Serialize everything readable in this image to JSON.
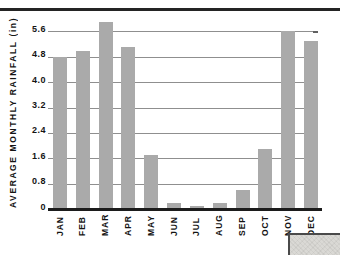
{
  "page": {
    "background": "#ffffff",
    "top_rule_color": "#242424",
    "corner_fragment_color": "#dad9d5"
  },
  "chart_data": {
    "type": "bar",
    "title": "",
    "ylabel": "AVERAGE MONTHLY RAINFALL (in)",
    "xlabel": "",
    "categories": [
      "JAN",
      "FEB",
      "MAR",
      "APR",
      "MAY",
      "JUN",
      "JUL",
      "AUG",
      "SEP",
      "OCT",
      "NOV",
      "DEC"
    ],
    "values": [
      4.8,
      5.0,
      5.9,
      5.1,
      1.7,
      0.2,
      0.1,
      0.2,
      0.6,
      1.9,
      5.6,
      5.3
    ],
    "ylim": [
      0,
      6.0
    ],
    "yticks": [
      0,
      0.8,
      1.6,
      2.4,
      3.2,
      4.0,
      4.8,
      5.6
    ],
    "ytick_labels": [
      "0",
      "0.8",
      "1.6",
      "2.4",
      "3.2",
      "4.0",
      "4.8",
      "5.6"
    ],
    "grid": true,
    "legend": false,
    "bar_color": "#aaaaaa",
    "gridline_color": "#8f8f8f",
    "tick_stub_color": "#616161",
    "axis_color": "#1c1c1c",
    "text_color": "#141414"
  }
}
